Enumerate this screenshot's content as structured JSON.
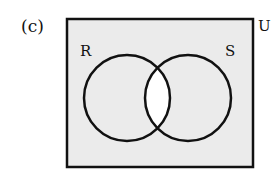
{
  "figure": {
    "part_label": "(c)",
    "universe_label": "U",
    "sets": [
      {
        "name": "R"
      },
      {
        "name": "S"
      }
    ],
    "shaded_region": "complement of R ∩ S",
    "unshaded_region": "R ∩ S",
    "colors": {
      "shade": "#ebebeb",
      "stroke": "#111111",
      "unshaded": "#ffffff"
    }
  }
}
